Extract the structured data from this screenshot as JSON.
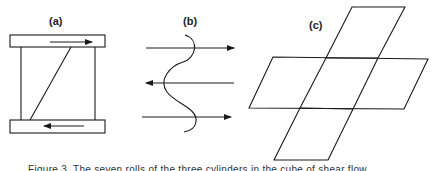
{
  "panels": {
    "a": {
      "label": "(a)",
      "description": "Simple shear block between two plates moving in opposite directions"
    },
    "b": {
      "label": "(b)",
      "description": "Wavy interface with alternating flow arrows (right, left, right)"
    },
    "c": {
      "label": "(c)",
      "description": "Cross-shaped net of five sheared parallelograms"
    }
  },
  "caption": {
    "text": "Figure 3.  The seven rolls of the three cylinders in the cube of shear flow"
  },
  "colors": {
    "stroke": "#1a1a1a",
    "background": "#ffffff"
  }
}
